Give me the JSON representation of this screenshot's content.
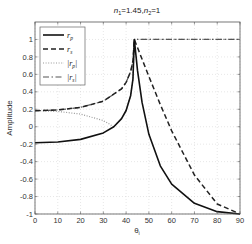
{
  "chart_data": {
    "type": "line",
    "title": "n1=1.45,n2=1",
    "title_parts": {
      "n": "n",
      "s1": "1",
      "eq1": "=1.45,",
      "s2": "2",
      "eq2": "=1"
    },
    "xlabel": "θi",
    "xlabel_parts": {
      "main": "θ",
      "sub": "i"
    },
    "ylabel": "Amplitude",
    "xlim": [
      0,
      90
    ],
    "ylim": [
      -1,
      1.2
    ],
    "xticks": [
      0,
      10,
      20,
      30,
      40,
      50,
      60,
      70,
      80,
      90
    ],
    "yticks": [
      -1,
      -0.8,
      -0.6,
      -0.4,
      -0.2,
      0,
      0.2,
      0.4,
      0.6,
      0.8,
      1
    ],
    "ytick_labels": [
      "-1",
      "-0.8",
      "-0.6",
      "-0.4",
      "-0.2",
      "0",
      "0.2",
      "0.4",
      "0.6",
      "0.8",
      "1"
    ],
    "grid": true,
    "legend_position": "upper left",
    "series": [
      {
        "name": "r_p",
        "label_main": "r",
        "label_sub": "p",
        "abs": false,
        "style": "solid",
        "color": "#111111",
        "width": 1.6,
        "x": [
          0,
          10,
          20,
          30,
          34.6,
          38,
          40,
          42,
          43,
          43.6,
          45,
          47,
          50,
          55,
          60,
          70,
          80,
          90
        ],
        "y": [
          -0.184,
          -0.175,
          -0.145,
          -0.071,
          0.0,
          0.093,
          0.186,
          0.358,
          0.545,
          1.0,
          0.645,
          0.279,
          -0.087,
          -0.448,
          -0.658,
          -0.878,
          -0.973,
          -1.0
        ]
      },
      {
        "name": "r_s",
        "label_main": "r",
        "label_sub": "s",
        "abs": false,
        "style": "dashed",
        "color": "#222222",
        "width": 1.5,
        "x": [
          0,
          10,
          20,
          30,
          38,
          40,
          42,
          43,
          43.6,
          45,
          50,
          55,
          60,
          70,
          80,
          90
        ],
        "y": [
          0.184,
          0.192,
          0.222,
          0.292,
          0.434,
          0.508,
          0.633,
          0.754,
          1.0,
          0.907,
          0.576,
          0.255,
          -0.047,
          -0.554,
          -0.885,
          -1.0
        ]
      },
      {
        "name": "|r_p|",
        "label_main": "r",
        "label_sub": "p",
        "abs": true,
        "style": "dotted",
        "color": "#999999",
        "width": 1.2,
        "x": [
          0,
          10,
          20,
          30,
          34.6,
          38,
          40,
          42,
          43,
          43.6,
          90
        ],
        "y": [
          0.184,
          0.175,
          0.145,
          0.071,
          0.0,
          0.093,
          0.186,
          0.358,
          0.545,
          1.0,
          1.0
        ]
      },
      {
        "name": "|r_s|",
        "label_main": "r",
        "label_sub": "s",
        "abs": true,
        "style": "dashdot",
        "color": "#555555",
        "width": 1.2,
        "x": [
          0,
          10,
          20,
          30,
          38,
          40,
          42,
          43,
          43.6,
          90
        ],
        "y": [
          0.184,
          0.192,
          0.222,
          0.292,
          0.434,
          0.508,
          0.633,
          0.754,
          1.0,
          1.0
        ]
      }
    ]
  }
}
